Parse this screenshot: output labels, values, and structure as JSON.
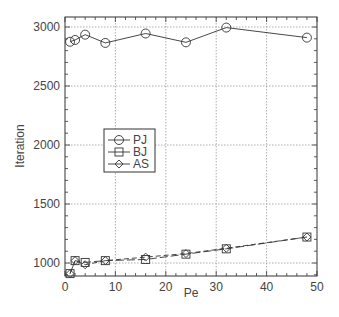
{
  "chart_data": {
    "type": "line",
    "title": "",
    "xlabel": "Pe",
    "ylabel": "Iteration",
    "xlim": [
      0,
      50
    ],
    "ylim": [
      890,
      3085
    ],
    "xticks": [
      0,
      10,
      20,
      30,
      40,
      50
    ],
    "yticks": [
      1000,
      1500,
      2000,
      2500,
      3000
    ],
    "grid": true,
    "legend_position": "inside-left-middle",
    "series": [
      {
        "name": "PJ",
        "marker": "circle",
        "line": "solid",
        "x": [
          1,
          2,
          4,
          8,
          16,
          24,
          32,
          48
        ],
        "y": [
          2875,
          2890,
          2935,
          2865,
          2945,
          2870,
          2995,
          2910
        ]
      },
      {
        "name": "BJ",
        "marker": "square",
        "line": "dashed",
        "x": [
          1,
          2,
          4,
          8,
          16,
          24,
          32,
          48
        ],
        "y": [
          910,
          1020,
          1005,
          1020,
          1030,
          1075,
          1120,
          1220
        ]
      },
      {
        "name": "AS",
        "marker": "diamond",
        "line": "dashed",
        "x": [
          1,
          2,
          4,
          8,
          16,
          24,
          32,
          48
        ],
        "y": [
          910,
          1020,
          985,
          1020,
          1050,
          1080,
          1125,
          1220
        ]
      }
    ]
  },
  "labels": {
    "xlabel": "Pe",
    "ylabel": "Iteration",
    "xticks": [
      "0",
      "10",
      "20",
      "30",
      "40",
      "50"
    ],
    "yticks": [
      "1000",
      "1500",
      "2000",
      "2500",
      "3000"
    ],
    "legend": [
      "PJ",
      "BJ",
      "AS"
    ]
  }
}
